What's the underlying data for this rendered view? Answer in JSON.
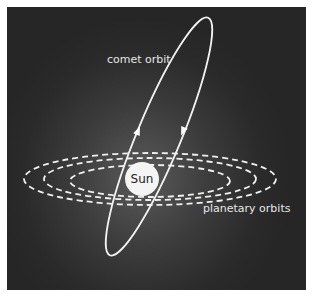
{
  "diagram": {
    "labels": {
      "comet": "comet orbit",
      "planets": "planetary orbits",
      "sun": "Sun"
    },
    "colors": {
      "background_center": "#5a5a5a",
      "background_edge": "#262626",
      "orbit_line": "#f2f2f2",
      "sun_fill": "#f4f4f4",
      "text": "#e6e6e6"
    },
    "elements": {
      "sun": {
        "cx": 142,
        "cy": 179,
        "r": 17
      },
      "planetary_orbits": [
        {
          "cx": 150,
          "cy": 179,
          "rx": 126,
          "ry": 26
        },
        {
          "cx": 150,
          "cy": 179,
          "rx": 106,
          "ry": 21
        },
        {
          "cx": 150,
          "cy": 181,
          "rx": 80,
          "ry": 16
        }
      ],
      "comet_orbit": {
        "cx": 159,
        "cy": 136,
        "rx": 22,
        "ry": 128,
        "rotation_deg": 22.5
      },
      "direction_arrows": [
        {
          "x": 138,
          "y": 133,
          "direction": "up"
        },
        {
          "x": 183,
          "y": 131,
          "direction": "down"
        }
      ]
    }
  }
}
